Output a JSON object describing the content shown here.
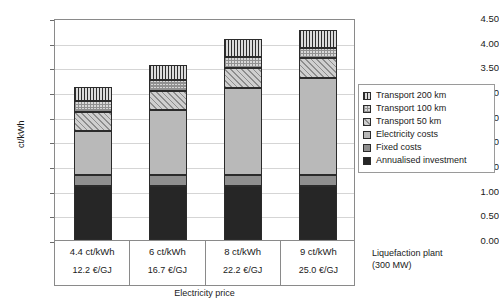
{
  "chart_data": {
    "type": "bar",
    "stacked": true,
    "title": "",
    "xlabel": "Electricity price",
    "ylabel": "ct/kWh",
    "ylim": [
      0.0,
      4.5
    ],
    "ytick_step": 0.5,
    "ytick_labels": [
      "0.00",
      "0.50",
      "1.00",
      "1.50",
      "2.00",
      "2.50",
      "3.00",
      "3.50",
      "4.00",
      "4.50"
    ],
    "grid": true,
    "legend_position": "right",
    "categories": [
      "4.4 ct/kWh",
      "6 ct/kWh",
      "8 ct/kWh",
      "9 ct/kWh"
    ],
    "category_sublabels": [
      "12.2 €/GJ",
      "16.7 €/GJ",
      "22.2 €/GJ",
      "25.0 €/GJ"
    ],
    "series": [
      {
        "name": "Annualised investment",
        "values": [
          1.09,
          1.09,
          1.09,
          1.09
        ],
        "color": "#262626",
        "pattern": "solid"
      },
      {
        "name": "Fixed costs",
        "values": [
          0.23,
          0.23,
          0.23,
          0.23
        ],
        "color": "#8f8f8f",
        "pattern": "solid"
      },
      {
        "name": "Electricity costs",
        "values": [
          0.89,
          1.31,
          1.76,
          1.96
        ],
        "color": "#b9b9b9",
        "pattern": "solid"
      },
      {
        "name": "Transport 50 km",
        "values": [
          0.38,
          0.4,
          0.4,
          0.4
        ],
        "color": "#cfcfcf",
        "pattern": "diagonal-hatch"
      },
      {
        "name": "Transport 100 km",
        "values": [
          0.23,
          0.22,
          0.22,
          0.22
        ],
        "color": "#d8d8d8",
        "pattern": "checker"
      },
      {
        "name": "Transport 200 km",
        "values": [
          0.28,
          0.29,
          0.37,
          0.35
        ],
        "color": "#d0d0d0",
        "pattern": "vertical-stripes"
      }
    ],
    "totals": [
      3.1,
      3.54,
      4.07,
      4.25
    ]
  },
  "legend": {
    "items": [
      {
        "label": "Transport 200 km"
      },
      {
        "label": "Transport 100 km"
      },
      {
        "label": "Transport 50 km"
      },
      {
        "label": "Electricity costs"
      },
      {
        "label": "Fixed costs"
      },
      {
        "label": "Annualised investment"
      }
    ]
  },
  "caption": {
    "line1": "Liquefaction plant",
    "line2": "(300 MW)"
  }
}
